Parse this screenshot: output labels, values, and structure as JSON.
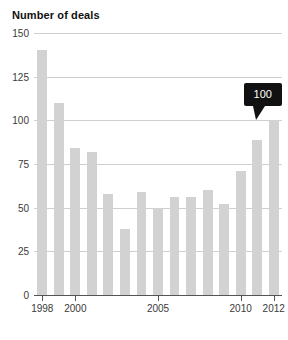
{
  "chart_data": {
    "type": "bar",
    "title": "Number of deals",
    "xlabel": "",
    "ylabel": "",
    "categories": [
      "1998",
      "1999",
      "2000",
      "2001",
      "2002",
      "2003",
      "2004",
      "2005",
      "2006",
      "2007",
      "2008",
      "2009",
      "2010",
      "2011",
      "2012"
    ],
    "values": [
      140,
      110,
      84,
      82,
      58,
      38,
      59,
      50,
      56,
      56,
      60,
      52,
      71,
      89,
      100
    ],
    "ylim": [
      0,
      150
    ],
    "yticks": [
      0,
      25,
      50,
      75,
      100,
      125,
      150
    ],
    "ytick_labels": [
      "0",
      "25",
      "50",
      "75",
      "100",
      "125",
      "150"
    ],
    "xtick_labels": [
      "1998",
      "2000",
      "2005",
      "2010",
      "2012"
    ],
    "xtick_categories": [
      "1998",
      "2000",
      "2005",
      "2010",
      "2012"
    ],
    "grid": true,
    "legend": false,
    "bar_color": "#d2d2d2",
    "gridline_color": "#cfcfcf",
    "axis_color": "#555555",
    "annotations": [
      {
        "label": "100",
        "target_category": "2012",
        "value": 100,
        "background_color": "#111111",
        "text_color": "#ffffff"
      }
    ]
  }
}
